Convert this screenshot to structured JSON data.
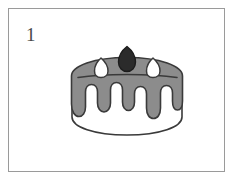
{
  "canvas": {
    "width": 234,
    "height": 180,
    "background_color": "#ffffff"
  },
  "panel": {
    "name": "illustration-panel",
    "border_color": "#9a9a9a",
    "background_color": "#ffffff",
    "index_label": "1",
    "index_color": "#4a4a4a"
  },
  "illustration": {
    "subject": "cake",
    "description": "Line drawing of a round layer cake with gray frosting dripping down the sides, a dark berry on top, and two white cream dollops",
    "style": "black-outline line art with flat gray fill",
    "outline_color": "#3a3a3a",
    "parts": [
      {
        "name": "cake-base",
        "label": "Cake base",
        "fill_color": "#ffffff",
        "outline_color": "#3a3a3a"
      },
      {
        "name": "frosting-top",
        "label": "Frosting top surface",
        "fill_color": "#8c8c8c",
        "outline_color": "#3a3a3a"
      },
      {
        "name": "frosting-drips",
        "label": "Dripping frosting",
        "fill_color": "#8c8c8c",
        "outline_color": "#3a3a3a",
        "drip_count": 6
      },
      {
        "name": "rim-line",
        "label": "Top rim line",
        "outline_color": "#3a3a3a"
      },
      {
        "name": "berry",
        "label": "Berry topping",
        "fill_color": "#2b2b2b",
        "outline_color": "#1c1c1c"
      },
      {
        "name": "cream-dollop-left",
        "label": "Left cream dollop",
        "fill_color": "#ffffff",
        "outline_color": "#3a3a3a"
      },
      {
        "name": "cream-dollop-right",
        "label": "Right cream dollop",
        "fill_color": "#ffffff",
        "outline_color": "#3a3a3a"
      }
    ]
  }
}
